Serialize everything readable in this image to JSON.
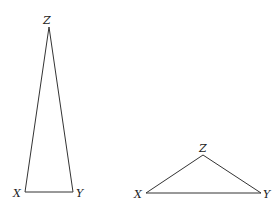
{
  "figure": {
    "triangles": [
      {
        "name": "tall-triangle",
        "vertices": {
          "X": {
            "label": "X",
            "x": 25,
            "y": 192
          },
          "Y": {
            "label": "Y",
            "x": 73,
            "y": 192
          },
          "Z": {
            "label": "Z",
            "x": 49,
            "y": 27
          }
        }
      },
      {
        "name": "wide-triangle",
        "vertices": {
          "X": {
            "label": "X",
            "x": 146,
            "y": 193
          },
          "Y": {
            "label": "Y",
            "x": 261,
            "y": 193
          },
          "Z": {
            "label": "Z",
            "x": 203,
            "y": 155
          }
        }
      }
    ]
  }
}
